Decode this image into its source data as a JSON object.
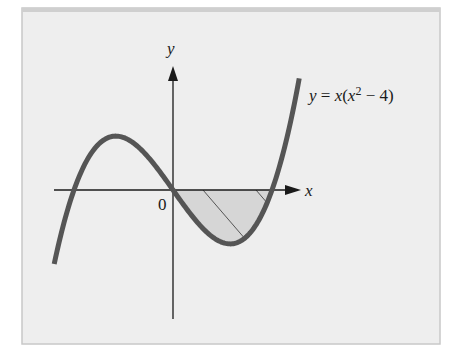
{
  "figure": {
    "equation_label": {
      "y": "y",
      "eq": " = ",
      "x": "x",
      "open": "(",
      "x2": "x",
      "exp": "2",
      "rest": " − 4)"
    },
    "axis_labels": {
      "x": "x",
      "y": "y",
      "origin": "0"
    },
    "colors": {
      "panel_bg": "#eeeeee",
      "panel_border": "#c8c8c8",
      "curve": "#555555",
      "axes": "#1a1a1a",
      "shade": "#d6d6d6",
      "hatch": "#555555"
    }
  },
  "chart_data": {
    "type": "line",
    "title": "",
    "function": "y = x(x^2 - 4)",
    "series": [
      {
        "name": "y = x(x^2 - 4)",
        "x": [
          -2.4,
          -2.0,
          -1.6,
          -1.155,
          -0.8,
          -0.4,
          0,
          0.4,
          0.8,
          1.155,
          1.6,
          2.0,
          2.3,
          2.55
        ],
        "y": [
          -4.22,
          0,
          2.3,
          3.08,
          2.69,
          1.54,
          0,
          -1.54,
          -2.69,
          -3.08,
          -2.3,
          0,
          2.97,
          6.38
        ]
      }
    ],
    "shaded_region": {
      "from_x": 0,
      "to_x": 2,
      "between": [
        "curve",
        "x-axis"
      ],
      "style": "gray fill with diagonal hatching"
    },
    "key_points": {
      "roots": [
        -2,
        0,
        2
      ],
      "local_max": [
        -1.155,
        3.08
      ],
      "local_min": [
        1.155,
        -3.08
      ]
    },
    "xlabel": "x",
    "ylabel": "y",
    "origin_label": "0",
    "grid": false,
    "ticks": false
  }
}
